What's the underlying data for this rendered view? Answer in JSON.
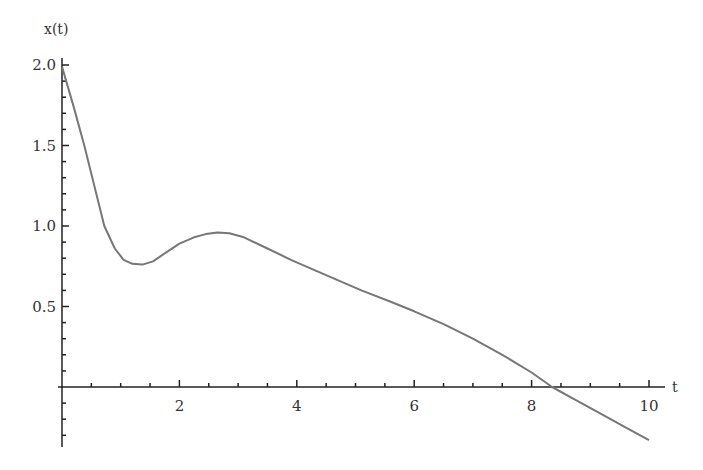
{
  "chart_data": {
    "type": "line",
    "title": "",
    "xlabel": "t",
    "ylabel": "x(t)",
    "xlim": [
      0,
      10
    ],
    "ylim": [
      -0.35,
      2.0
    ],
    "grid": false,
    "legend": null,
    "x_ticks": [
      2,
      4,
      6,
      8,
      10
    ],
    "x_tick_labels": [
      "2",
      "4",
      "6",
      "8",
      "10"
    ],
    "y_ticks": [
      0.5,
      1.0,
      1.5,
      2.0
    ],
    "y_tick_labels": [
      "0.5",
      "1.0",
      "1.5",
      "2.0"
    ],
    "line_color": "#777777",
    "axis_color": "#222222",
    "series": [
      {
        "name": "x(t)",
        "x": [
          0,
          0.2,
          0.38,
          0.55,
          0.72,
          0.9,
          1.05,
          1.2,
          1.37,
          1.55,
          1.75,
          2.0,
          2.25,
          2.45,
          2.65,
          2.85,
          3.1,
          3.5,
          3.9,
          4.4,
          5.1,
          5.6,
          6.0,
          6.5,
          7.0,
          7.5,
          8.0,
          8.35,
          8.7,
          9.2,
          9.6,
          10.0
        ],
        "values": [
          1.99,
          1.74,
          1.5,
          1.25,
          1.0,
          0.86,
          0.79,
          0.765,
          0.76,
          0.78,
          0.83,
          0.89,
          0.93,
          0.95,
          0.96,
          0.955,
          0.93,
          0.86,
          0.79,
          0.71,
          0.6,
          0.53,
          0.47,
          0.39,
          0.3,
          0.2,
          0.09,
          0.0,
          -0.07,
          -0.17,
          -0.25,
          -0.33
        ]
      }
    ]
  }
}
